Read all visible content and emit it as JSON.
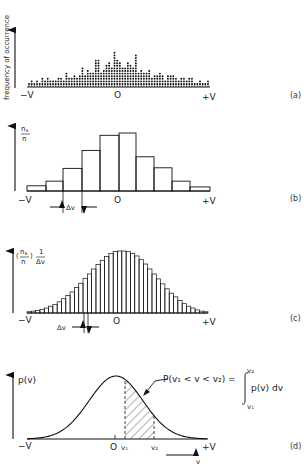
{
  "panels": {
    "a": {
      "tag": "(a)",
      "ylabel": "frequency of occurrence",
      "x_left": "−V",
      "x_mid": "O",
      "x_right": "+V"
    },
    "b": {
      "tag": "(b)",
      "ylabel_num": "n",
      "ylabel_sub": "x",
      "ylabel_den": "n",
      "x_left": "−V",
      "x_mid": "O",
      "x_right": "+V",
      "delta": "Δv"
    },
    "c": {
      "tag": "(c)",
      "ylabel_num": "n",
      "ylabel_sub": "x",
      "ylabel_den": "n",
      "ylabel_factor_num": "1",
      "ylabel_factor_den": "Δv",
      "x_left": "−V",
      "x_mid": "O",
      "x_right": "+V",
      "delta": "Δv"
    },
    "d": {
      "tag": "(d)",
      "ylabel": "p(v)",
      "x_left": "−V",
      "x_mid": "O",
      "x_right": "+V",
      "v1": "v₁",
      "v2": "v₂",
      "axis_var": "v",
      "prob_expr": "P(v₁ < v < v₂) =",
      "integral_upper": "v₂",
      "integral_lower": "v₁",
      "integrand": "p(v) dv"
    }
  },
  "chart_data": [
    {
      "type": "scatter",
      "title": "(a) dot frequency diagram",
      "ylabel": "frequency of occurrence",
      "xlabel": "",
      "tick_labels": [
        "-V",
        "O",
        "+V"
      ],
      "note": "dot column heights per sampling interval from -V to +V",
      "values": [
        1,
        2,
        1,
        2,
        1,
        3,
        2,
        3,
        2,
        2,
        2,
        3,
        3,
        2,
        5,
        3,
        3,
        4,
        3,
        4,
        7,
        4,
        6,
        5,
        5,
        10,
        10,
        5,
        6,
        8,
        9,
        7,
        13,
        10,
        9,
        7,
        7,
        9,
        8,
        7,
        12,
        5,
        6,
        5,
        5,
        6,
        3,
        4,
        4,
        5,
        4,
        2,
        4,
        4,
        4,
        3,
        2,
        3,
        3,
        2,
        3,
        3,
        1,
        1,
        2,
        1,
        1,
        2
      ]
    },
    {
      "type": "bar",
      "title": "(b) histogram n_x/n",
      "ylabel": "n_x / n",
      "tick_labels": [
        "-V",
        "O",
        "+V"
      ],
      "categories": [
        1,
        2,
        3,
        4,
        5,
        6,
        7,
        8,
        9,
        10
      ],
      "values": [
        0.09,
        0.17,
        0.39,
        0.7,
        0.96,
        1.0,
        0.59,
        0.4,
        0.17,
        0.07
      ]
    },
    {
      "type": "bar",
      "title": "(c) fine histogram (n_x/n)(1/Δv)",
      "ylabel": "(n_x/n)(1/Δv)",
      "tick_labels": [
        "-V",
        "O",
        "+V"
      ],
      "note": "approx. normal-shaped envelope, ~40 narrow bins",
      "values": [
        0.02,
        0.03,
        0.04,
        0.06,
        0.08,
        0.11,
        0.14,
        0.18,
        0.23,
        0.28,
        0.34,
        0.41,
        0.48,
        0.56,
        0.63,
        0.71,
        0.78,
        0.85,
        0.91,
        0.96,
        0.99,
        1.0,
        1.0,
        0.99,
        0.96,
        0.92,
        0.86,
        0.79,
        0.71,
        0.63,
        0.55,
        0.47,
        0.39,
        0.32,
        0.26,
        0.2,
        0.15,
        0.11,
        0.08,
        0.05,
        0.03,
        0.02
      ]
    },
    {
      "type": "line",
      "title": "(d) probability density p(v)",
      "ylabel": "p(v)",
      "xlabel": "v",
      "tick_labels": [
        "-V",
        "O",
        "v₁",
        "v₂",
        "+V"
      ],
      "note": "smooth bell curve; hatched region between v1 and v2 represents P(v1 < v < v2)",
      "shaded_interval": [
        "v1",
        "v2"
      ]
    }
  ]
}
